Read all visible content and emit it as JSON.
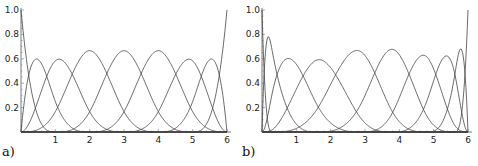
{
  "chart_data": [
    {
      "type": "line",
      "panel_label": "a)",
      "title": "",
      "xlabel": "",
      "ylabel": "",
      "xlim": [
        0,
        6
      ],
      "ylim": [
        0,
        1.0
      ],
      "x_ticks": [
        "1",
        "2",
        "3",
        "4",
        "5",
        "6"
      ],
      "y_ticks": [
        "0.2",
        "0.4",
        "0.6",
        "0.8",
        "1.0"
      ],
      "grid": false,
      "description": "Cubic B-spline basis functions, clamped uniform knot vector",
      "degree": 3,
      "knots": [
        0,
        0,
        0,
        0,
        1,
        2,
        3,
        4,
        5,
        6,
        6,
        6,
        6
      ],
      "peaks": [
        {
          "x": 0.0,
          "y": 1.0
        },
        {
          "x": 0.5,
          "y": 0.59
        },
        {
          "x": 1.1,
          "y": 0.59
        },
        {
          "x": 2.0,
          "y": 0.667
        },
        {
          "x": 3.0,
          "y": 0.667
        },
        {
          "x": 4.0,
          "y": 0.667
        },
        {
          "x": 4.9,
          "y": 0.59
        },
        {
          "x": 5.5,
          "y": 0.59
        },
        {
          "x": 6.0,
          "y": 1.0
        }
      ]
    },
    {
      "type": "line",
      "panel_label": "b)",
      "title": "",
      "xlabel": "",
      "ylabel": "",
      "xlim": [
        0,
        6
      ],
      "ylim": [
        0,
        1.0
      ],
      "x_ticks": [
        "1",
        "2",
        "3",
        "4",
        "5",
        "6"
      ],
      "y_ticks": [
        "0.2",
        "0.4",
        "0.6",
        "0.8",
        "1.0"
      ],
      "grid": false,
      "description": "Cubic B-spline basis functions, clamped non-uniform knot vector",
      "degree": 3,
      "knots": [
        0,
        0,
        0,
        0,
        0.3,
        1.6,
        2.9,
        3.8,
        4.8,
        5.6,
        6,
        6,
        6,
        6
      ],
      "peaks": [
        {
          "x": 0.0,
          "y": 1.0
        },
        {
          "x": 0.3,
          "y": 0.77
        },
        {
          "x": 1.1,
          "y": 0.54
        },
        {
          "x": 2.2,
          "y": 0.56
        },
        {
          "x": 3.3,
          "y": 0.76
        },
        {
          "x": 4.2,
          "y": 0.62
        },
        {
          "x": 5.1,
          "y": 0.53
        },
        {
          "x": 5.7,
          "y": 0.73
        },
        {
          "x": 6.0,
          "y": 1.0
        }
      ]
    }
  ]
}
